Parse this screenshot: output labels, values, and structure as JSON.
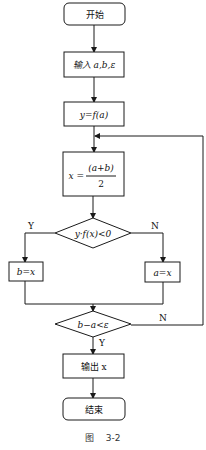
{
  "nodes": {
    "start": {
      "label": "开始"
    },
    "input": {
      "label": "输入 a,b,ε"
    },
    "assign_y": {
      "label": "y=f(a)"
    },
    "assign_x": {
      "lhs": "x =",
      "numerator": "(a+b)",
      "denominator": "2"
    },
    "decision1": {
      "label": "y·f(x)<0"
    },
    "assign_b": {
      "label": "b=x"
    },
    "assign_a": {
      "label": "a=x"
    },
    "decision2": {
      "label": "b−a<ε"
    },
    "output": {
      "label": "输出 x"
    },
    "end": {
      "label": "结束"
    }
  },
  "edges": {
    "d1_yes": "Y",
    "d1_no": "N",
    "d2_yes": "Y",
    "d2_no": "N"
  },
  "caption": "图    3-2"
}
